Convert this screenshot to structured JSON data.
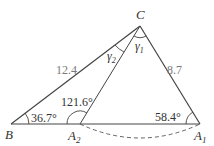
{
  "diagram": {
    "type": "triangle-ambiguous-case",
    "vertices": {
      "B": {
        "label": "B",
        "x": 11,
        "y": 124
      },
      "A2": {
        "label": "A",
        "sub": "2",
        "x": 80,
        "y": 124
      },
      "A1": {
        "label": "A",
        "sub": "1",
        "x": 200,
        "y": 124
      },
      "C": {
        "label": "C",
        "x": 140,
        "y": 26
      }
    },
    "sides": {
      "BC": "12.4",
      "CA": "8.7"
    },
    "angles": {
      "B": "36.7°",
      "A2": "121.6°",
      "A1": "58.4°",
      "gamma1": "γ",
      "gamma1_sub": "1",
      "gamma2": "γ",
      "gamma2_sub": "2"
    },
    "colors": {
      "line": "#444444",
      "dashed": "#555555",
      "side_label": "#7a7a7a"
    }
  }
}
